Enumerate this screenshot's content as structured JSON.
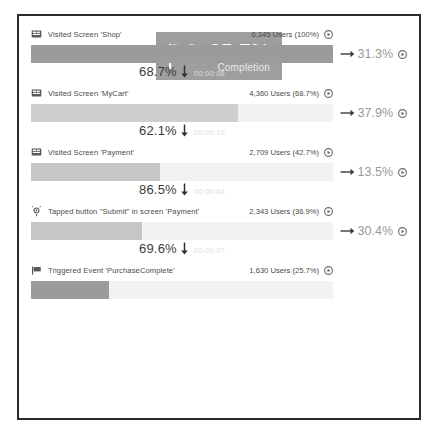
{
  "chart_data": {
    "type": "bar",
    "xlabel": "",
    "ylabel": "Users",
    "grid": false,
    "legend": "none",
    "total_users": 6345,
    "categories": [
      "Visited Screen 'Shop'",
      "Visited Screen 'MyCart'",
      "Visited Screen 'Payment'",
      "Tapped button \"Submit\" in screen 'Payment'",
      "Triggered Event 'PurchaseComplete'"
    ],
    "values": [
      6345,
      4360,
      2709,
      2343,
      1630
    ],
    "percent_of_total": [
      100,
      68.7,
      42.7,
      36.9,
      25.7
    ],
    "conversion_to_next": [
      68.7,
      62.1,
      86.5,
      69.6,
      null
    ],
    "dropoff_to_next": [
      31.3,
      37.9,
      13.5,
      30.4,
      null
    ],
    "avg_time_to_next": [
      "00:00:08",
      "00:00:10",
      "00:00:04",
      "00:00:07",
      null
    ],
    "completion_rate": 25.7
  },
  "colors": {
    "bar_fill_dark": "#9b9b9b",
    "bar_fill_light": "#cfcfcf",
    "bar_track": "#f2f2f2",
    "badge_background": "#9e9e9e",
    "frame_border": "#2b2b2b",
    "dropoff_text": "#9a9a9a"
  },
  "steps": [
    {
      "icon": "screen-icon",
      "label": "Visited Screen 'Shop'",
      "users": "6,345 Users (100%)",
      "bar_percent": 100,
      "fill_shade": "dark",
      "dropoff": "31.3%",
      "conversion": "68.7%",
      "time": "00:00:08"
    },
    {
      "icon": "screen-icon",
      "label": "Visited Screen 'MyCart'",
      "users": "4,360 Users (68.7%)",
      "bar_percent": 68.7,
      "fill_shade": "light",
      "dropoff": "37.9%",
      "conversion": "62.1%",
      "time": "00:00:10"
    },
    {
      "icon": "screen-icon",
      "label": "Visited Screen 'Payment'",
      "users": "2,709 Users (42.7%)",
      "bar_percent": 42.7,
      "fill_shade": "mid",
      "dropoff": "13.5%",
      "conversion": "86.5%",
      "time": "00:00:04"
    },
    {
      "icon": "tap-icon",
      "label": "Tapped button \"Submit\" in screen 'Payment'",
      "users": "2,343 Users (36.9%)",
      "bar_percent": 36.9,
      "fill_shade": "mid",
      "dropoff": "30.4%",
      "conversion": "69.6%",
      "time": "00:00:07"
    },
    {
      "icon": "flag-icon",
      "label": "Triggered Event 'PurchaseComplete'",
      "users": "1,630 Users (25.7%)",
      "bar_percent": 25.7,
      "fill_shade": "dark",
      "dropoff": null,
      "conversion": null,
      "time": null
    }
  ],
  "completion": {
    "icon": "checkered-flag-icon",
    "percent": "25.7%",
    "label": "Completion"
  }
}
